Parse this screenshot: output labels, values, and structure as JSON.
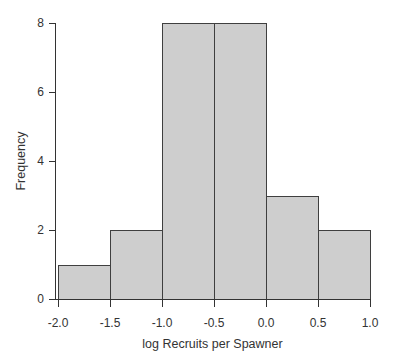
{
  "figure": {
    "kind": "histogram"
  },
  "chart_data": {
    "type": "bar",
    "subtype": "histogram",
    "title": "",
    "xlabel": "log Recruits per Spawner",
    "ylabel": "Frequency",
    "bin_edges": [
      -2.0,
      -1.5,
      -1.0,
      -0.5,
      0.0,
      0.5,
      1.0
    ],
    "counts": [
      1,
      2,
      8,
      8,
      3,
      2
    ],
    "xlim": [
      -2.0,
      1.0
    ],
    "ylim": [
      0,
      8
    ],
    "x_tick_values": [
      -2.0,
      -1.5,
      -1.0,
      -0.5,
      0.0,
      0.5,
      1.0
    ],
    "x_tick_labels": [
      "-2.0",
      "-1.5",
      "-1.0",
      "-0.5",
      "0.0",
      "0.5",
      "1.0"
    ],
    "y_tick_values": [
      0,
      2,
      4,
      6,
      8
    ],
    "y_tick_labels": [
      "0",
      "2",
      "4",
      "6",
      "8"
    ],
    "grid": false,
    "legend": null,
    "colors": {
      "bar_fill": "#cecece",
      "bar_stroke": "#3f3f3f",
      "axis": "#333333",
      "text": "#333333",
      "background": "#ffffff"
    }
  }
}
